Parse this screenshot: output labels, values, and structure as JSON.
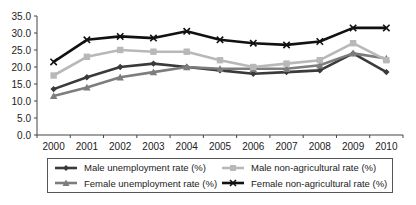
{
  "chart_data": {
    "type": "line",
    "title": "",
    "xlabel": "",
    "ylabel": "",
    "ylim": [
      0,
      35
    ],
    "yticks": [
      "0.0",
      "5.0",
      "10.0",
      "15.0",
      "20.0",
      "25.0",
      "30.0",
      "35.0"
    ],
    "grid": false,
    "legend_position": "bottom",
    "categories": [
      "2000",
      "2001",
      "2002",
      "2003",
      "2004",
      "2005",
      "2006",
      "2007",
      "2008",
      "2009",
      "2010"
    ],
    "series": [
      {
        "name": "Male unemployment rate (%)",
        "marker": "diamond",
        "color": "#3a3a3a",
        "values": [
          13.5,
          17.0,
          20.0,
          21.0,
          20.0,
          19.0,
          18.0,
          18.5,
          19.0,
          24.0,
          18.5
        ]
      },
      {
        "name": "Female unemployment rate (%)",
        "marker": "triangle",
        "color": "#7d7d7d",
        "values": [
          11.5,
          14.0,
          17.0,
          18.5,
          20.0,
          19.5,
          19.5,
          19.5,
          20.5,
          24.0,
          22.5
        ]
      },
      {
        "name": "Male non-agricultural rate (%)",
        "marker": "square",
        "color": "#b8b8b8",
        "values": [
          17.5,
          23.0,
          25.0,
          24.5,
          24.5,
          22.0,
          20.0,
          21.0,
          22.0,
          27.0,
          22.0
        ]
      },
      {
        "name": "Female non-agricultural rate (%)",
        "marker": "x",
        "color": "#111111",
        "values": [
          21.5,
          28.0,
          29.0,
          28.5,
          30.5,
          28.0,
          27.0,
          26.5,
          27.5,
          31.5,
          31.5
        ]
      }
    ]
  },
  "legend": {
    "items": [
      {
        "label": "Male unemployment rate (%)",
        "marker": "diamond",
        "color": "#3a3a3a"
      },
      {
        "label": "Male non-agricultural rate (%)",
        "marker": "square",
        "color": "#b8b8b8"
      },
      {
        "label": "Female unemployment rate (%)",
        "marker": "triangle",
        "color": "#7d7d7d"
      },
      {
        "label": "Female non-agricultural rate (%)",
        "marker": "x",
        "color": "#111111"
      }
    ]
  }
}
